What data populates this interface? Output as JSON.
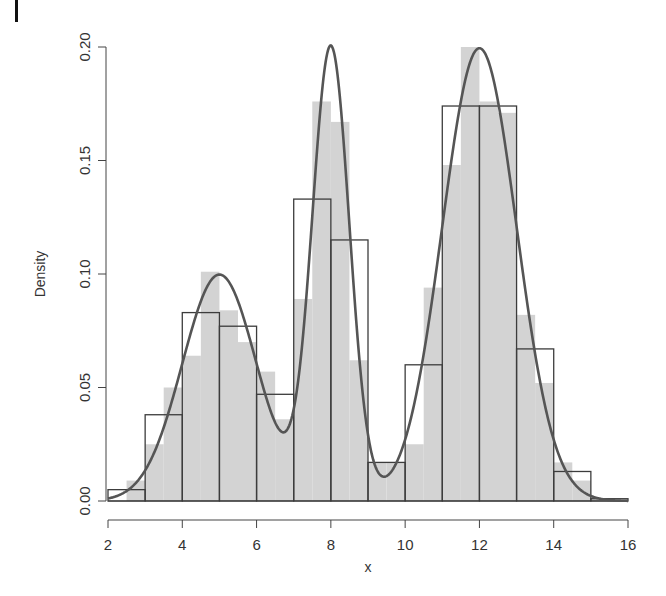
{
  "chart_data": {
    "type": "histogram",
    "title": "",
    "xlabel": "x",
    "ylabel": "Density",
    "xlim": [
      2,
      16
    ],
    "ylim": [
      0,
      0.2
    ],
    "x_ticks": [
      2,
      4,
      6,
      8,
      10,
      12,
      14,
      16
    ],
    "x_tick_labels": [
      "2",
      "4",
      "6",
      "8",
      "10",
      "12",
      "14",
      "16"
    ],
    "y_ticks": [
      0.0,
      0.05,
      0.1,
      0.15,
      0.2
    ],
    "y_tick_labels": [
      "0.00",
      "0.05",
      "0.10",
      "0.15",
      "0.20"
    ],
    "grid": false,
    "legend": null,
    "series": [
      {
        "name": "fine histogram (binwidth 0.5, gray fill)",
        "type": "bar",
        "bin_edges": [
          2,
          2.5,
          3,
          3.5,
          4,
          4.5,
          5,
          5.5,
          6,
          6.5,
          7,
          7.5,
          8,
          8.5,
          9,
          9.5,
          10,
          10.5,
          11,
          11.5,
          12,
          12.5,
          13,
          13.5,
          14,
          14.5,
          15,
          15.5,
          16
        ],
        "values": [
          0.0,
          0.009,
          0.025,
          0.05,
          0.064,
          0.101,
          0.084,
          0.07,
          0.057,
          0.036,
          0.089,
          0.176,
          0.167,
          0.062,
          0.017,
          0.017,
          0.025,
          0.094,
          0.148,
          0.2,
          0.176,
          0.171,
          0.082,
          0.052,
          0.017,
          0.009,
          0.001,
          0.001
        ],
        "color": "#d3d3d3"
      },
      {
        "name": "coarse histogram (binwidth 1, outlined)",
        "type": "bar",
        "bin_edges": [
          2,
          3,
          4,
          5,
          6,
          7,
          8,
          9,
          10,
          11,
          12,
          13,
          14,
          15,
          16
        ],
        "values": [
          0.005,
          0.038,
          0.083,
          0.077,
          0.047,
          0.133,
          0.115,
          0.017,
          0.06,
          0.174,
          0.174,
          0.067,
          0.013,
          0.001
        ],
        "color": "#444444"
      },
      {
        "name": "true density curve",
        "type": "line",
        "formula": "0.25*N(5,1) + 0.25*N(8,0.5) + 0.5*N(12,1)",
        "x": [
          2,
          3,
          4,
          5,
          6,
          6.7,
          7,
          7.5,
          8,
          8.5,
          9,
          9.4,
          10,
          11,
          12,
          13,
          14,
          15,
          16
        ],
        "values": [
          0.001,
          0.013,
          0.06,
          0.1,
          0.061,
          0.031,
          0.038,
          0.122,
          0.2,
          0.122,
          0.029,
          0.011,
          0.028,
          0.121,
          0.2,
          0.121,
          0.027,
          0.002,
          0.0
        ],
        "color": "#555555"
      }
    ]
  },
  "mixture": {
    "components": [
      {
        "weight": 0.25,
        "mean": 5,
        "sd": 1
      },
      {
        "weight": 0.25,
        "mean": 8,
        "sd": 0.5
      },
      {
        "weight": 0.5,
        "mean": 12,
        "sd": 1
      }
    ]
  },
  "layout": {
    "plot_left": 108,
    "plot_right": 628,
    "baseline_y": 501,
    "px_per_unit_x": 37.142857,
    "px_per_unit_y": 2270
  },
  "colors": {
    "fine_fill": "#d3d3d3",
    "coarse_stroke": "#3c3c3c",
    "curve": "#555555",
    "axis": "#444444"
  }
}
